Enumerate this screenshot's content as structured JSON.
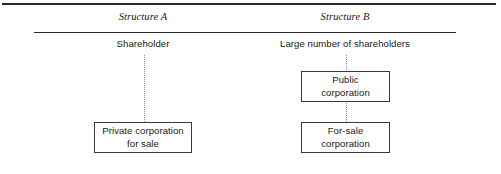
{
  "figure": {
    "rules": {
      "top_rule": "horizontal-rule",
      "heading_rule": "horizontal-rule"
    }
  },
  "columns": [
    {
      "id": "structure-a",
      "heading": "Structure A",
      "owner_caption": "Shareholder",
      "connector": "dotted-vertical-line",
      "boxes": [
        {
          "id": "private-corporation-for-sale",
          "line1": "Private corporation",
          "line2": "for sale"
        }
      ]
    },
    {
      "id": "structure-b",
      "heading": "Structure B",
      "owner_caption": "Large number of shareholders",
      "connector": "dotted-vertical-line",
      "boxes": [
        {
          "id": "public-corporation",
          "line1": "Public",
          "line2": "corporation"
        },
        {
          "id": "for-sale-corporation",
          "line1": "For-sale",
          "line2": "corporation"
        }
      ]
    }
  ],
  "colors": {
    "background": "#ffffff",
    "text": "#1a1a1a",
    "rule": "#2b2b2b",
    "box_border": "#3a3a3a",
    "connector": "#8f8f8f"
  }
}
